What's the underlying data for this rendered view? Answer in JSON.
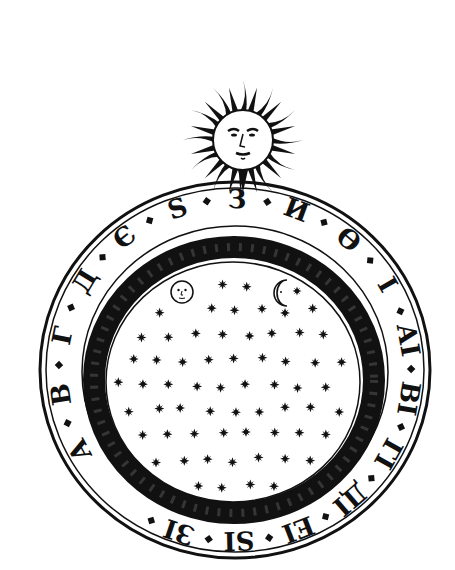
{
  "image": {
    "description": "Engraving of a circular cosmological diagram: sun with face above a starry sky disc with moon faces, surrounded by a ring of Cyrillic numeral letters",
    "colors": {
      "ink": "#111111",
      "paper": "#ffffff"
    }
  },
  "sun": {
    "label": "sun-with-face",
    "cx": 243,
    "cy": 140,
    "r": 30,
    "rays": 24
  },
  "sky": {
    "cx": 233,
    "cy": 385,
    "r": 128,
    "moons": [
      {
        "type": "full-moon-face",
        "x": 182,
        "y": 292
      },
      {
        "type": "crescent-moon-face",
        "x": 285,
        "y": 293
      }
    ]
  },
  "ring": {
    "cx": 235,
    "cy": 370,
    "letters": [
      "А",
      "В",
      "Г",
      "Д",
      "Є",
      "Ѕ",
      "З",
      "И",
      "Ѳ",
      "І",
      "АІ",
      "ВІ",
      "ГІ",
      "ДІ",
      "ЕІ",
      "ЅІ",
      "ЗІ"
    ]
  }
}
